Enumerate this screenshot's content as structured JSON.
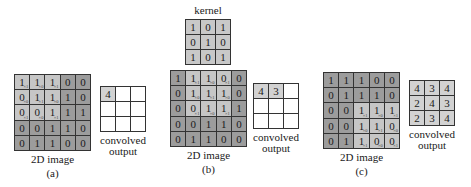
{
  "kernel": {
    "title": "kernel",
    "values": [
      [
        1,
        0,
        1
      ],
      [
        0,
        1,
        0
      ],
      [
        1,
        0,
        1
      ]
    ]
  },
  "image": [
    [
      1,
      1,
      1,
      0,
      0
    ],
    [
      0,
      1,
      1,
      1,
      0
    ],
    [
      0,
      0,
      1,
      1,
      1
    ],
    [
      0,
      0,
      1,
      1,
      0
    ],
    [
      0,
      1,
      1,
      0,
      0
    ]
  ],
  "panels": [
    {
      "id": "a",
      "caption": "(a)",
      "image_label": "2D image",
      "output_label_1": "convolved",
      "output_label_2": "output",
      "highlight": {
        "row": 0,
        "col": 0
      },
      "output": [
        [
          "4",
          "",
          ""
        ],
        [
          "",
          "",
          ""
        ],
        [
          "",
          "",
          ""
        ]
      ]
    },
    {
      "id": "b",
      "caption": "(b)",
      "image_label": "2D image",
      "output_label_1": "convolved",
      "output_label_2": "output",
      "highlight": {
        "row": 0,
        "col": 1
      },
      "output": [
        [
          "4",
          "3",
          ""
        ],
        [
          "",
          "",
          ""
        ],
        [
          "",
          "",
          ""
        ]
      ]
    },
    {
      "id": "c",
      "caption": "(c)",
      "image_label": "2D image",
      "output_label_1": "convolved",
      "output_label_2": "output",
      "highlight": {
        "row": 2,
        "col": 2
      },
      "output": [
        [
          "4",
          "3",
          "4"
        ],
        [
          "2",
          "4",
          "3"
        ],
        [
          "2",
          "3",
          "4"
        ]
      ]
    }
  ],
  "layout": {
    "image_grids": [
      {
        "x": 14,
        "y": 74
      },
      {
        "x": 170,
        "y": 70
      },
      {
        "x": 323,
        "y": 72
      }
    ],
    "output_grids": [
      {
        "x": 100,
        "y": 86
      },
      {
        "x": 253,
        "y": 83
      },
      {
        "x": 409,
        "y": 80
      }
    ],
    "kernel_grid": {
      "x": 185,
      "y": 19
    }
  },
  "colors": {
    "highlight": "#c6c6c6",
    "cell": "#9c9c9c",
    "kernel": "#c8c8c8",
    "output_filled": "#d2d2d2"
  }
}
